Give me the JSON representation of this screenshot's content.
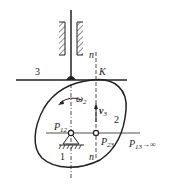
{
  "diagram": {
    "type": "cam-follower mechanism (velocity instant centers)",
    "labels": {
      "link3": "3",
      "contact_point": "K",
      "normal_top": "n",
      "normal_bottom": "n",
      "omega": "ω",
      "omega_sub": "2",
      "velocity": "v",
      "velocity_sub": "3",
      "link2": "2",
      "link1": "1",
      "p12": "P",
      "p12_sub": "12",
      "p23": "P",
      "p23_sub": "23",
      "p13": "P",
      "p13_sub": "13",
      "p13_suffix": "→∞"
    },
    "colors": {
      "stroke": "#222222",
      "background": "#ffffff"
    }
  }
}
